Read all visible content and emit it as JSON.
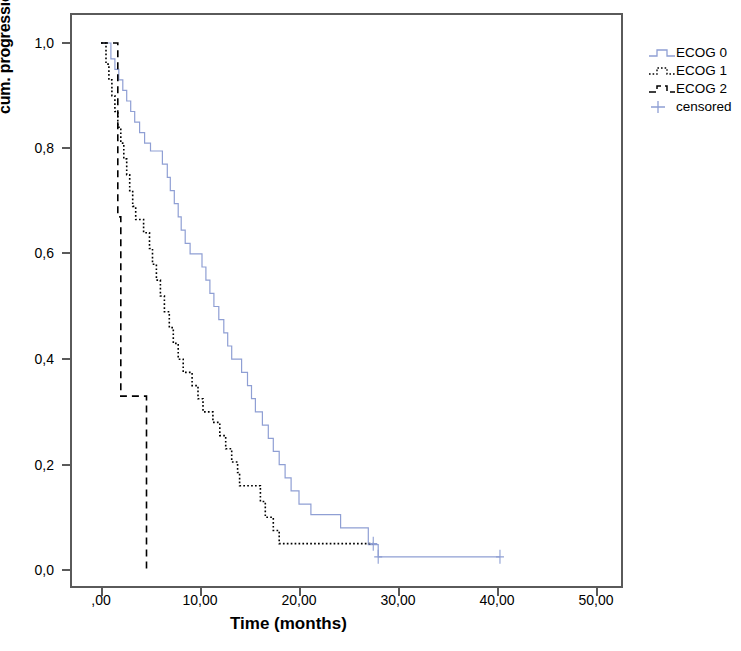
{
  "chart_data": {
    "type": "line",
    "title": "",
    "subtitle": "",
    "xlabel": "Time (months)",
    "ylabel": "cum. progression-free survival",
    "xlim": [
      0,
      53
    ],
    "ylim": [
      0,
      1.05
    ],
    "xticks": [
      0,
      10,
      20,
      30,
      40,
      50
    ],
    "xticklabels": [
      ",00",
      "10,00",
      "20,00",
      "30,00",
      "40,00",
      "50,00"
    ],
    "yticks": [
      0.0,
      0.2,
      0.4,
      0.6,
      0.8,
      1.0
    ],
    "yticklabels": [
      "0,0",
      "0,2",
      "0,4",
      "0,6",
      "0,8",
      "1,0"
    ],
    "grid": false,
    "legend_position": "right-top",
    "legend": [
      "ECOG 0",
      "ECOG 1",
      "ECOG 2",
      "censored"
    ],
    "colors": {
      "ecog0": "#8f9fd4",
      "ecog1": "#000000",
      "ecog2": "#000000",
      "censored": "#8f9fd4",
      "axis": "#5a5a5a"
    },
    "series": [
      {
        "name": "ECOG 0",
        "style": "solid",
        "color": "#8f9fd4",
        "steps": [
          [
            0.0,
            1.0
          ],
          [
            1.0,
            1.0
          ],
          [
            1.0,
            0.97
          ],
          [
            1.4,
            0.97
          ],
          [
            1.4,
            0.95
          ],
          [
            1.8,
            0.95
          ],
          [
            1.8,
            0.93
          ],
          [
            2.2,
            0.93
          ],
          [
            2.2,
            0.91
          ],
          [
            2.6,
            0.91
          ],
          [
            2.6,
            0.89
          ],
          [
            3.0,
            0.89
          ],
          [
            3.0,
            0.87
          ],
          [
            3.4,
            0.87
          ],
          [
            3.4,
            0.85
          ],
          [
            3.9,
            0.85
          ],
          [
            3.9,
            0.83
          ],
          [
            4.4,
            0.83
          ],
          [
            4.4,
            0.81
          ],
          [
            5.0,
            0.81
          ],
          [
            5.0,
            0.795
          ],
          [
            6.2,
            0.795
          ],
          [
            6.2,
            0.77
          ],
          [
            6.7,
            0.77
          ],
          [
            6.7,
            0.745
          ],
          [
            7.0,
            0.745
          ],
          [
            7.0,
            0.72
          ],
          [
            7.4,
            0.72
          ],
          [
            7.4,
            0.695
          ],
          [
            7.8,
            0.695
          ],
          [
            7.8,
            0.67
          ],
          [
            8.1,
            0.67
          ],
          [
            8.1,
            0.645
          ],
          [
            8.5,
            0.645
          ],
          [
            8.5,
            0.62
          ],
          [
            9.0,
            0.62
          ],
          [
            9.0,
            0.6
          ],
          [
            10.2,
            0.6
          ],
          [
            10.2,
            0.575
          ],
          [
            10.6,
            0.575
          ],
          [
            10.6,
            0.55
          ],
          [
            11.0,
            0.55
          ],
          [
            11.0,
            0.525
          ],
          [
            11.4,
            0.525
          ],
          [
            11.4,
            0.5
          ],
          [
            11.9,
            0.5
          ],
          [
            11.9,
            0.475
          ],
          [
            12.4,
            0.475
          ],
          [
            12.4,
            0.45
          ],
          [
            12.8,
            0.45
          ],
          [
            12.8,
            0.425
          ],
          [
            13.2,
            0.425
          ],
          [
            13.2,
            0.4
          ],
          [
            14.2,
            0.4
          ],
          [
            14.2,
            0.375
          ],
          [
            14.8,
            0.375
          ],
          [
            14.8,
            0.35
          ],
          [
            15.2,
            0.35
          ],
          [
            15.2,
            0.325
          ],
          [
            15.6,
            0.325
          ],
          [
            15.6,
            0.3
          ],
          [
            16.3,
            0.3
          ],
          [
            16.3,
            0.275
          ],
          [
            16.9,
            0.275
          ],
          [
            16.9,
            0.25
          ],
          [
            17.4,
            0.25
          ],
          [
            17.4,
            0.225
          ],
          [
            18.0,
            0.225
          ],
          [
            18.0,
            0.2
          ],
          [
            18.6,
            0.2
          ],
          [
            18.6,
            0.175
          ],
          [
            19.2,
            0.175
          ],
          [
            19.2,
            0.15
          ],
          [
            20.0,
            0.15
          ],
          [
            20.0,
            0.125
          ],
          [
            21.2,
            0.125
          ],
          [
            21.2,
            0.105
          ],
          [
            24.2,
            0.105
          ],
          [
            24.2,
            0.08
          ],
          [
            27.0,
            0.08
          ],
          [
            27.0,
            0.048
          ],
          [
            28.0,
            0.048
          ],
          [
            28.0,
            0.025
          ],
          [
            40.3,
            0.025
          ]
        ],
        "censored_points": [
          [
            28.0,
            0.025
          ],
          [
            40.3,
            0.025
          ]
        ]
      },
      {
        "name": "ECOG 1",
        "style": "dotted",
        "color": "#000000",
        "steps": [
          [
            0.0,
            1.0
          ],
          [
            0.5,
            1.0
          ],
          [
            0.5,
            0.96
          ],
          [
            0.8,
            0.96
          ],
          [
            0.8,
            0.93
          ],
          [
            1.1,
            0.93
          ],
          [
            1.1,
            0.9
          ],
          [
            1.4,
            0.9
          ],
          [
            1.4,
            0.87
          ],
          [
            1.7,
            0.87
          ],
          [
            1.7,
            0.84
          ],
          [
            2.0,
            0.84
          ],
          [
            2.0,
            0.81
          ],
          [
            2.3,
            0.81
          ],
          [
            2.3,
            0.78
          ],
          [
            2.6,
            0.78
          ],
          [
            2.6,
            0.75
          ],
          [
            2.9,
            0.75
          ],
          [
            2.9,
            0.72
          ],
          [
            3.2,
            0.72
          ],
          [
            3.2,
            0.69
          ],
          [
            3.5,
            0.69
          ],
          [
            3.5,
            0.665
          ],
          [
            4.3,
            0.665
          ],
          [
            4.3,
            0.64
          ],
          [
            4.9,
            0.64
          ],
          [
            4.9,
            0.61
          ],
          [
            5.2,
            0.61
          ],
          [
            5.2,
            0.58
          ],
          [
            5.6,
            0.58
          ],
          [
            5.6,
            0.55
          ],
          [
            6.0,
            0.55
          ],
          [
            6.0,
            0.52
          ],
          [
            6.4,
            0.52
          ],
          [
            6.4,
            0.49
          ],
          [
            6.9,
            0.49
          ],
          [
            6.9,
            0.46
          ],
          [
            7.3,
            0.46
          ],
          [
            7.3,
            0.43
          ],
          [
            7.8,
            0.43
          ],
          [
            7.8,
            0.4
          ],
          [
            8.3,
            0.4
          ],
          [
            8.3,
            0.375
          ],
          [
            9.2,
            0.375
          ],
          [
            9.2,
            0.35
          ],
          [
            9.8,
            0.35
          ],
          [
            9.8,
            0.325
          ],
          [
            10.3,
            0.325
          ],
          [
            10.3,
            0.3
          ],
          [
            11.3,
            0.3
          ],
          [
            11.3,
            0.28
          ],
          [
            12.0,
            0.28
          ],
          [
            12.0,
            0.255
          ],
          [
            12.6,
            0.255
          ],
          [
            12.6,
            0.23
          ],
          [
            13.2,
            0.23
          ],
          [
            13.2,
            0.205
          ],
          [
            13.8,
            0.205
          ],
          [
            13.8,
            0.185
          ],
          [
            14.0,
            0.185
          ],
          [
            14.0,
            0.16
          ],
          [
            16.1,
            0.16
          ],
          [
            16.1,
            0.13
          ],
          [
            16.6,
            0.13
          ],
          [
            16.6,
            0.1
          ],
          [
            17.4,
            0.1
          ],
          [
            17.4,
            0.075
          ],
          [
            18.0,
            0.075
          ],
          [
            18.0,
            0.05
          ],
          [
            27.5,
            0.05
          ]
        ],
        "censored_points": [
          [
            27.5,
            0.05
          ]
        ]
      },
      {
        "name": "ECOG 2",
        "style": "dashed",
        "color": "#000000",
        "steps": [
          [
            0.0,
            1.0
          ],
          [
            1.7,
            1.0
          ],
          [
            1.7,
            0.67
          ],
          [
            2.0,
            0.67
          ],
          [
            2.0,
            0.33
          ],
          [
            4.6,
            0.33
          ],
          [
            4.6,
            0.0
          ]
        ],
        "censored_points": []
      }
    ]
  },
  "legend": {
    "items": [
      {
        "label": "ECOG 0",
        "key": "step-solid"
      },
      {
        "label": "ECOG 1",
        "key": "step-dotted"
      },
      {
        "label": "ECOG 2",
        "key": "step-dashed"
      },
      {
        "label": "censored",
        "key": "plus-marker"
      }
    ]
  },
  "axes": {
    "y_title": "cum. progression-free survival",
    "x_title": "Time (months)",
    "y_labels": [
      "1,0",
      "0,8",
      "0,6",
      "0,4",
      "0,2",
      "0,0"
    ],
    "x_labels": [
      ",00",
      "10,00",
      "20,00",
      "30,00",
      "40,00",
      "50,00"
    ]
  }
}
